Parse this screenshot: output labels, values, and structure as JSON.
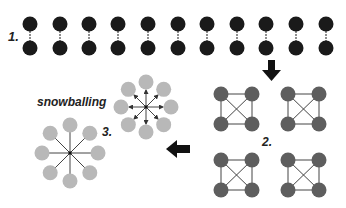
{
  "labels": {
    "step1": "1.",
    "step2": "2.",
    "step3": "3.",
    "snowballing": "snowballing"
  },
  "colors": {
    "pair_node": "#1a1a1a",
    "clique_node": "#5e5e5e",
    "star_node": "#b8b8b8",
    "edge": "#444444",
    "arrow": "#111111"
  },
  "pairs_x": [
    30,
    60,
    89,
    118,
    148,
    178,
    207,
    237,
    266,
    296,
    326
  ],
  "cliques": [
    {
      "x": 221,
      "y": 94
    },
    {
      "x": 288,
      "y": 94
    },
    {
      "x": 221,
      "y": 160
    },
    {
      "x": 288,
      "y": 160
    }
  ],
  "stars": [
    {
      "cx": 146,
      "cy": 107,
      "r": 25,
      "arrows": true
    },
    {
      "cx": 70,
      "cy": 153,
      "r": 28,
      "arrows": false
    }
  ]
}
